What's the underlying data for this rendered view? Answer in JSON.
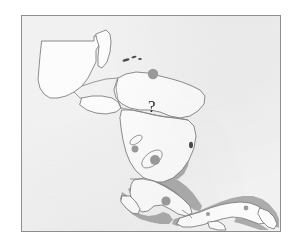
{
  "figure": {
    "kind": "distribution-map",
    "region_title": "Central America",
    "frame": {
      "x": 21,
      "y": 15,
      "width": 260,
      "height": 217
    },
    "background_color": "#f1f1f1",
    "page_color": "#ffffff",
    "border_color": "#8e8e8e"
  },
  "annotations": {
    "question_mark": {
      "label": "?",
      "x": 152,
      "y": 110,
      "meaning": "unknown-or-unconfirmed-occurrence"
    }
  },
  "symbology": {
    "outline_color": "#7a7a7a",
    "land_fill": "#fbfbfb",
    "occurrence_marker_color": "#9a9a9a",
    "coastal_band_color": "#a6a6a6",
    "island_color": "#555555",
    "lake_outline_color": "#8a8a8a"
  },
  "countries": [
    {
      "name": "Guatemala"
    },
    {
      "name": "Belize"
    },
    {
      "name": "Honduras"
    },
    {
      "name": "El Salvador"
    },
    {
      "name": "Nicaragua"
    },
    {
      "name": "Costa Rica"
    },
    {
      "name": "Panama"
    }
  ],
  "features": {
    "point_markers": [
      {
        "name": "northern-honduras-marker",
        "x": 152,
        "y": 73,
        "r": 5.2
      },
      {
        "name": "lake-nicaragua-marker",
        "x": 134,
        "y": 148,
        "r": 3.4
      },
      {
        "name": "nicaragua-pacific-marker",
        "x": 154,
        "y": 159,
        "r": 5.0
      },
      {
        "name": "costa-rica-pacific-marker",
        "x": 165,
        "y": 200,
        "r": 4.6
      },
      {
        "name": "panama-interior-marker",
        "x": 245,
        "y": 207,
        "r": 2.4
      }
    ],
    "islands": [
      {
        "name": "bay-islands-west",
        "x": 124,
        "y": 58
      },
      {
        "name": "bay-islands-mid",
        "x": 131,
        "y": 56
      },
      {
        "name": "bay-islands-east",
        "x": 137,
        "y": 59
      }
    ],
    "lakes": [
      {
        "name": "lake-managua"
      },
      {
        "name": "lake-nicaragua"
      }
    ],
    "coastal_bands": [
      {
        "name": "caribbean-nicaragua-band"
      },
      {
        "name": "costa-rica-coastal-band"
      },
      {
        "name": "panama-coastal-band"
      }
    ]
  }
}
